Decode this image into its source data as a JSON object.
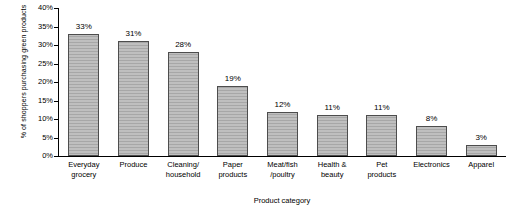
{
  "chart_data": {
    "type": "bar",
    "title": "",
    "xlabel": "Product category",
    "ylabel": "% of shoppers purchasing green products",
    "categories": [
      "Everyday grocery",
      "Produce",
      "Cleaning/ household",
      "Paper products",
      "Meat/fish /poultry",
      "Health & beauty",
      "Pet products",
      "Electronics",
      "Apparel"
    ],
    "category_lines": [
      [
        "Everyday",
        "grocery"
      ],
      [
        "Produce"
      ],
      [
        "Cleaning/",
        "household"
      ],
      [
        "Paper",
        "products"
      ],
      [
        "Meat/fish",
        "/poultry"
      ],
      [
        "Health &",
        "beauty"
      ],
      [
        "Pet",
        "products"
      ],
      [
        "Electronics"
      ],
      [
        "Apparel"
      ]
    ],
    "values": [
      33,
      31,
      28,
      19,
      12,
      11,
      11,
      8,
      3
    ],
    "value_labels": [
      "33%",
      "31%",
      "28%",
      "19%",
      "12%",
      "11%",
      "11%",
      "8%",
      "3%"
    ],
    "ylim": [
      0,
      40
    ],
    "yticks": [
      0,
      5,
      10,
      15,
      20,
      25,
      30,
      35,
      40
    ],
    "ytick_labels": [
      "0%",
      "5%",
      "10%",
      "15%",
      "20%",
      "25%",
      "30%",
      "35%",
      "40%"
    ],
    "grid": false,
    "legend": "none",
    "bar_color": "#a7a7a7",
    "bar_border_color": "#4d4d4d",
    "axis_color": "#000000"
  }
}
